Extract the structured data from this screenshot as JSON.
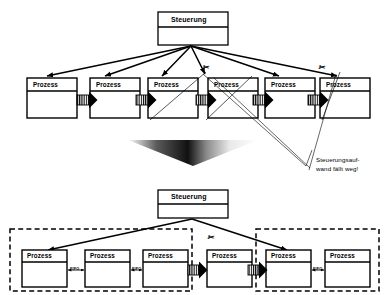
{
  "diagram": {
    "title_text": "Prozesskette Steuerung",
    "labels": {
      "steuerung": "Steuerung",
      "prozess": "Prozess",
      "fifo": "FIFO",
      "cut_mark": "✂"
    },
    "annotation": {
      "line1": "Steuerungsauf-",
      "line2": "wand fällt weg!"
    },
    "colors": {
      "stroke": "#000000",
      "fill": "#ffffff",
      "gradient_dark": "#2b2b2b",
      "gradient_light": "#ffffff",
      "dashed": "#000000"
    },
    "top_section": {
      "controller": {
        "label": "Steuerung"
      },
      "processes": [
        {
          "label": "Prozess"
        },
        {
          "label": "Prozess"
        },
        {
          "label": "Prozess"
        },
        {
          "label": "Prozess"
        },
        {
          "label": "Prozess"
        },
        {
          "label": "Prozess"
        }
      ],
      "cut_marks": [
        {
          "label": "✂"
        },
        {
          "label": "✂"
        }
      ]
    },
    "bottom_section": {
      "controller": {
        "label": "Steuerung"
      },
      "groups": [
        {
          "processes": [
            {
              "label": "Prozess"
            },
            {
              "label": "Prozess"
            },
            {
              "label": "Prozess"
            }
          ],
          "fifo_links": [
            {
              "label": "FIFO"
            },
            {
              "label": "FIFO"
            }
          ]
        },
        {
          "processes": [
            {
              "label": "Prozess"
            }
          ],
          "fifo_links": []
        },
        {
          "processes": [
            {
              "label": "Prozess"
            },
            {
              "label": "Prozess"
            }
          ],
          "fifo_links": [
            {
              "label": "FIFO"
            }
          ]
        }
      ],
      "cut_marks": [
        {
          "label": "✂"
        }
      ]
    }
  }
}
